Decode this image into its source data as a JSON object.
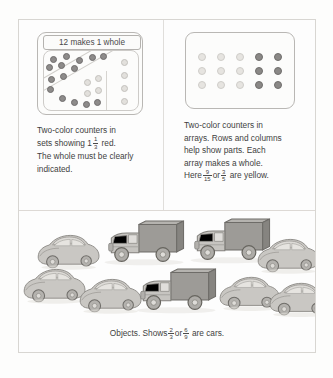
{
  "figure": {
    "cells": {
      "sets": {
        "box_label": "12 makes 1 whole",
        "caption_line1": "Two-color counters in",
        "caption_line2_pre": "sets showing",
        "caption_line2_mixed_whole": "1",
        "caption_line2_frac_num": "1",
        "caption_line2_frac_den": "3",
        "caption_line2_post": "red.",
        "caption_line3": "The whole must be clearly",
        "caption_line4": "indicated.",
        "counters": {
          "red_count": 12,
          "yellow_count": 12,
          "red_color": "#8d8b8a",
          "yellow_color": "#e2e0dc"
        }
      },
      "arrays": {
        "caption_line1": "Two-color counters in",
        "caption_line2": "arrays. Rows and columns",
        "caption_line3": "help show parts. Each",
        "caption_line4": "array makes a whole.",
        "caption_line5_pre": "Here",
        "caption_line5_frac1_num": "9",
        "caption_line5_frac1_den": "15",
        "caption_line5_or": "or",
        "caption_line5_frac2_num": "3",
        "caption_line5_frac2_den": "5",
        "caption_line5_post": "are yellow.",
        "array": {
          "rows": 3,
          "cols": 5,
          "yellow_cols": 3,
          "red_cols": 2,
          "yellow_color": "#e6e4e0",
          "red_color": "#8a8886"
        }
      },
      "objects": {
        "caption_pre": "Objects. Shows",
        "caption_frac1_num": "2",
        "caption_frac1_den": "3",
        "caption_or": "or",
        "caption_frac2_num": "6",
        "caption_frac2_den": "9",
        "caption_post": "are cars.",
        "cars": 6,
        "trucks": 3,
        "total": 9
      }
    }
  }
}
